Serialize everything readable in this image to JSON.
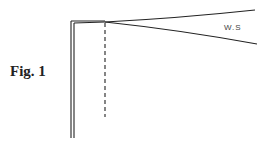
{
  "figure": {
    "label": "Fig. 1",
    "annotation": "W.S"
  }
}
